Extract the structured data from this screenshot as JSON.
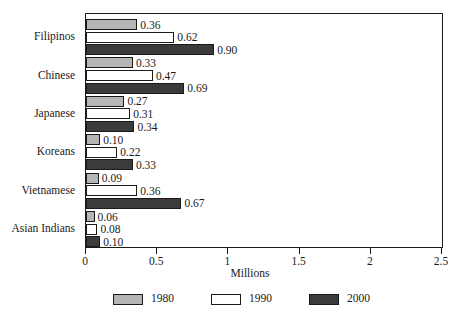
{
  "chart_data": {
    "type": "bar",
    "orientation": "horizontal",
    "title": "",
    "xlabel": "Millions",
    "ylabel": "",
    "xlim": [
      0,
      2.5
    ],
    "grid": false,
    "legend_position": "bottom",
    "categories": [
      "Filipinos",
      "Chinese",
      "Japanese",
      "Koreans",
      "Vietnamese",
      "Asian Indians"
    ],
    "xticks": [
      "0",
      "0.5",
      "1",
      "1.5",
      "2",
      "2.5"
    ],
    "xtick_values": [
      0,
      0.5,
      1,
      1.5,
      2,
      2.5
    ],
    "series": [
      {
        "name": "1980",
        "color": "#b5b5b5",
        "values": [
          0.36,
          0.33,
          0.27,
          0.1,
          0.09,
          0.06
        ],
        "labels": [
          "0.36",
          "0.33",
          "0.27",
          "0.10",
          "0.09",
          "0.06"
        ]
      },
      {
        "name": "1990",
        "color": "#ffffff",
        "values": [
          0.62,
          0.47,
          0.31,
          0.22,
          0.36,
          0.08
        ],
        "labels": [
          "0.62",
          "0.47",
          "0.31",
          "0.22",
          "0.36",
          "0.08"
        ]
      },
      {
        "name": "2000",
        "color": "#3b3b3b",
        "values": [
          0.9,
          0.69,
          0.34,
          0.33,
          0.67,
          0.1
        ],
        "labels": [
          "0.90",
          "0.69",
          "0.34",
          "0.33",
          "0.67",
          "0.10"
        ]
      }
    ]
  },
  "legend": {
    "items": [
      {
        "label": "1980",
        "color": "#b5b5b5"
      },
      {
        "label": "1990",
        "color": "#ffffff"
      },
      {
        "label": "2000",
        "color": "#3b3b3b"
      }
    ]
  },
  "axis": {
    "x_title": "Millions"
  }
}
